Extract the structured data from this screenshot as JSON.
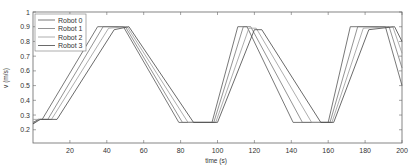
{
  "chart_data": {
    "type": "line",
    "title": "",
    "xlabel": "time (s)",
    "ylabel": "v (m/s)",
    "xlim": [
      0,
      200
    ],
    "ylim": [
      0.11,
      1.0
    ],
    "xticks": [
      20,
      40,
      60,
      80,
      100,
      120,
      140,
      160,
      180,
      200
    ],
    "yticks": [
      0.2,
      0.3,
      0.4,
      0.5,
      0.6,
      0.7,
      0.8,
      0.9,
      1
    ],
    "grid": false,
    "legend_position": "upper left",
    "series": [
      {
        "name": "Robot 0",
        "color": "#555555",
        "x": [
          0,
          3,
          5,
          35,
          49,
          79,
          97,
          111,
          116,
          141,
          160,
          172,
          191,
          200
        ],
        "y": [
          0.25,
          0.27,
          0.27,
          0.9,
          0.9,
          0.25,
          0.25,
          0.9,
          0.9,
          0.25,
          0.25,
          0.9,
          0.9,
          0.5
        ]
      },
      {
        "name": "Robot 1",
        "color": "#777777",
        "x": [
          0,
          3,
          8,
          38,
          50,
          81,
          98,
          114,
          118,
          146,
          161,
          176,
          193,
          200
        ],
        "y": [
          0.24,
          0.27,
          0.27,
          0.9,
          0.9,
          0.25,
          0.25,
          0.9,
          0.9,
          0.25,
          0.25,
          0.9,
          0.9,
          0.62
        ]
      },
      {
        "name": "Robot 2",
        "color": "#999999",
        "x": [
          0,
          4,
          10,
          41,
          51,
          84,
          99,
          117,
          121,
          151,
          162,
          179,
          195,
          200
        ],
        "y": [
          0.27,
          0.27,
          0.27,
          0.89,
          0.9,
          0.25,
          0.25,
          0.89,
          0.89,
          0.25,
          0.25,
          0.89,
          0.9,
          0.72
        ]
      },
      {
        "name": "Robot 3",
        "color": "#444444",
        "x": [
          0,
          4,
          13,
          44,
          52,
          87,
          100,
          120,
          124,
          156,
          163,
          182,
          196,
          200
        ],
        "y": [
          0.24,
          0.27,
          0.27,
          0.88,
          0.9,
          0.25,
          0.25,
          0.88,
          0.88,
          0.25,
          0.25,
          0.88,
          0.9,
          0.8
        ]
      }
    ]
  }
}
